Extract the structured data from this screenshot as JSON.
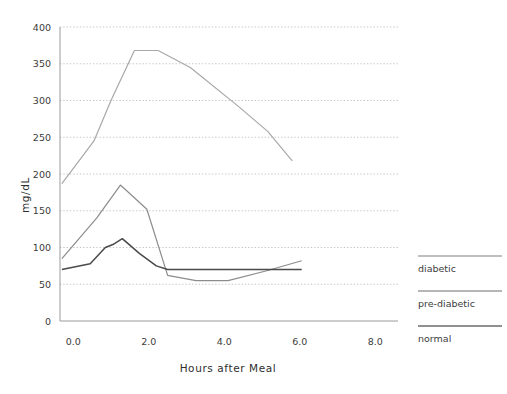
{
  "chart_data": {
    "type": "line",
    "title": "",
    "xlabel": "Hours after Meal",
    "ylabel": "mg/dL",
    "xlim": [
      -0.35,
      8.6
    ],
    "ylim": [
      0,
      400
    ],
    "xticks": [
      "0.0",
      "2.0",
      "4.0",
      "6.0",
      "8.0"
    ],
    "xtick_values": [
      0.0,
      2.0,
      4.0,
      6.0,
      8.0
    ],
    "yticks": [
      "0",
      "50",
      "100",
      "150",
      "200",
      "250",
      "300",
      "350",
      "400"
    ],
    "ytick_values": [
      0,
      50,
      100,
      150,
      200,
      250,
      300,
      350,
      400
    ],
    "grid": "horizontal-dotted",
    "legend_position": "right-outside",
    "series": [
      {
        "name": "diabetic",
        "color": "#a8a8a8",
        "width": 1.2,
        "x": [
          -0.3,
          0.55,
          1.0,
          1.62,
          2.25,
          3.1,
          4.35,
          5.15,
          5.8
        ],
        "y": [
          187,
          245,
          300,
          368,
          368,
          345,
          293,
          258,
          218
        ]
      },
      {
        "name": "pre-diabetic",
        "color": "#8c8c8c",
        "width": 1.2,
        "x": [
          -0.3,
          0.62,
          1.25,
          1.95,
          2.5,
          3.25,
          4.1,
          5.1,
          6.05
        ],
        "y": [
          85,
          140,
          185,
          152,
          62,
          55,
          55,
          68,
          82
        ]
      },
      {
        "name": "normal",
        "color": "#4a4a4a",
        "width": 1.5,
        "x": [
          -0.3,
          0.45,
          0.85,
          1.05,
          1.3,
          1.75,
          2.2,
          2.5,
          6.05
        ],
        "y": [
          70,
          78,
          100,
          104,
          112,
          92,
          75,
          70,
          70
        ]
      }
    ]
  },
  "legend": {
    "items": [
      {
        "label": "diabetic",
        "color": "#a8a8a8"
      },
      {
        "label": "pre-diabetic",
        "color": "#9e9e9e"
      },
      {
        "label": "normal",
        "color": "#6b6b6b"
      }
    ]
  }
}
